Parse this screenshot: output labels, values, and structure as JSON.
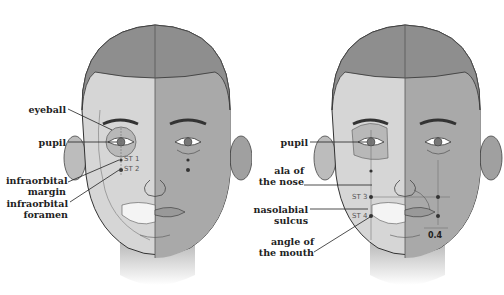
{
  "figures": [
    {
      "labels": {
        "eyeball": "eyeball",
        "pupil": "pupil",
        "infraorbital_margin": "infraorbital margin",
        "infraorbital_foramen": "infraorbital foramen"
      },
      "points": {
        "st1": "ST 1",
        "st2": "ST 2"
      }
    },
    {
      "labels": {
        "pupil": "pupil",
        "ala_of_nose": "ala of the nose",
        "nasolabial_sulcus": "nasolabial sulcus",
        "angle_of_mouth": "angle of the mouth"
      },
      "points": {
        "st3": "ST 3",
        "st4": "ST 4"
      },
      "measurement": "0.4"
    }
  ],
  "colors": {
    "skin_light": "#d8d8d8",
    "skin_dark": "#a8a8a8",
    "hair": "#8c8c8c",
    "line": "#333333"
  }
}
